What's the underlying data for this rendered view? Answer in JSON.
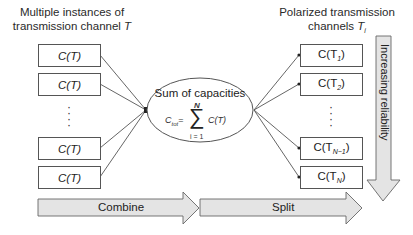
{
  "left": {
    "heading_line1": "Multiple instances of",
    "heading_line2": "transmission channel ",
    "heading_var": "T",
    "boxes": [
      "C(T)",
      "C(T)",
      "C(T)",
      "C(T)"
    ],
    "ellipsis": "⋮"
  },
  "center": {
    "title": "Sum of capacities",
    "formula_lhs": "C",
    "formula_lhs_sub": "tot",
    "formula_eq": "=",
    "sum_symbol": "∑",
    "sum_upper": "N",
    "sum_lower": "i = 1",
    "formula_rhs": "C(T)"
  },
  "right": {
    "heading_line1": "Polarized transmission",
    "heading_line2": "channels ",
    "heading_var": "T",
    "heading_sub": "i",
    "boxes": [
      {
        "base": "C(T",
        "sub": "1",
        "close": ")"
      },
      {
        "base": "C(T",
        "sub": "2",
        "close": ")"
      },
      {
        "base": "C(T",
        "sub": "N−1",
        "close": ")"
      },
      {
        "base": "C(T",
        "sub": "N",
        "close": ")"
      }
    ],
    "ellipsis": "⋮"
  },
  "arrows": {
    "combine": "Combine",
    "split": "Split",
    "reliability": "Increasing reliability"
  },
  "colors": {
    "arrow_fill": "#e4e4e4",
    "stroke": "#555555"
  }
}
